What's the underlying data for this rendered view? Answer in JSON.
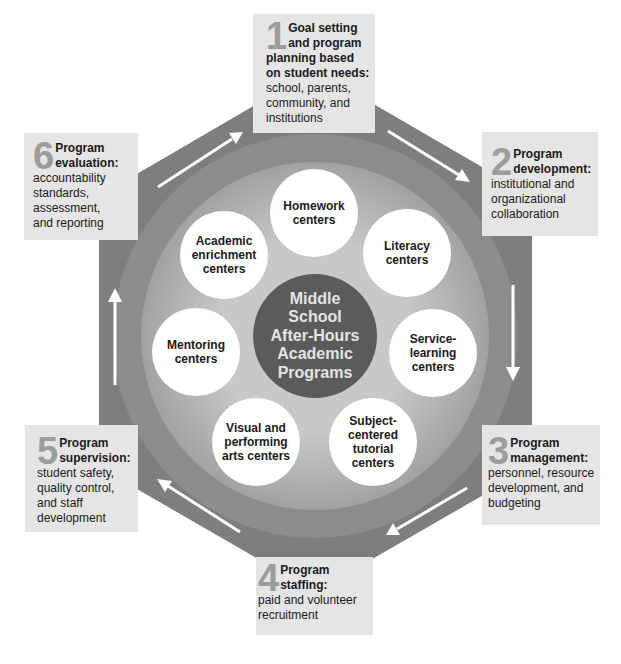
{
  "center": {
    "lines": [
      "Middle",
      "School",
      "After-Hours",
      "Academic",
      "Programs"
    ]
  },
  "programs": [
    {
      "lines": [
        "Homework",
        "centers"
      ]
    },
    {
      "lines": [
        "Literacy",
        "centers"
      ]
    },
    {
      "lines": [
        "Service-",
        "learning",
        "centers"
      ]
    },
    {
      "lines": [
        "Subject-",
        "centered",
        "tutorial",
        "centers"
      ]
    },
    {
      "lines": [
        "Visual and",
        "performing",
        "arts centers"
      ]
    },
    {
      "lines": [
        "Mentoring",
        "centers"
      ]
    },
    {
      "lines": [
        "Academic",
        "enrichment",
        "centers"
      ]
    }
  ],
  "steps": [
    {
      "number": "1",
      "title_lines": [
        "Goal setting",
        "and program",
        "planning based",
        "on student needs:"
      ],
      "desc_lines": [
        "school, parents,",
        "community, and",
        "institutions"
      ]
    },
    {
      "number": "2",
      "title_lines": [
        "Program",
        "development:"
      ],
      "desc_lines": [
        "institutional and",
        "organizational",
        "collaboration"
      ]
    },
    {
      "number": "3",
      "title_lines": [
        "Program",
        "management:"
      ],
      "desc_lines": [
        "personnel, resource",
        "development, and",
        "budgeting"
      ]
    },
    {
      "number": "4",
      "title_lines": [
        "Program",
        "staffing:"
      ],
      "desc_lines": [
        "paid and volunteer",
        "recruitment"
      ]
    },
    {
      "number": "5",
      "title_lines": [
        "Program",
        "supervision:"
      ],
      "desc_lines": [
        "student safety,",
        "quality control,",
        "and staff",
        "development"
      ]
    },
    {
      "number": "6",
      "title_lines": [
        "Program",
        "evaluation:"
      ],
      "desc_lines": [
        "accountability",
        "standards,",
        "assessment,",
        "and reporting"
      ]
    }
  ],
  "cycle_arrows": [
    {
      "from": "6",
      "to": "1",
      "icon": "arrow-up-right-icon"
    },
    {
      "from": "1",
      "to": "2",
      "icon": "arrow-down-right-icon"
    },
    {
      "from": "2",
      "to": "3",
      "icon": "arrow-down-icon"
    },
    {
      "from": "3",
      "to": "4",
      "icon": "arrow-down-left-icon"
    },
    {
      "from": "4",
      "to": "5",
      "icon": "arrow-up-left-icon"
    },
    {
      "from": "5",
      "to": "6",
      "icon": "arrow-up-icon"
    }
  ],
  "colors": {
    "hexagon": "#7e7e7e",
    "ring": "#8c8c8c",
    "disc_edge": "#a2a2a2",
    "disc_center": "#c8c8c8",
    "center_circle": "#5b5b5b",
    "center_text": "#e4e4e4",
    "program_circle": "#ffffff",
    "step_box": "#e5e5e5",
    "step_number": "#9c9c9c",
    "arrow": "#ffffff"
  }
}
